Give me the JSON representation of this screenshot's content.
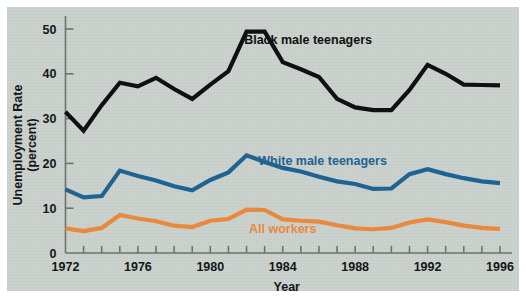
{
  "chart_data": {
    "type": "line",
    "title": "",
    "xlabel": "Year",
    "ylabel": "Unemployment Rate (percent)",
    "ylabel_line1": "Unemployment Rate",
    "ylabel_line2": "(percent)",
    "xlim": [
      1972,
      1996
    ],
    "ylim": [
      0,
      50
    ],
    "ytick_labels": [
      "0",
      "10",
      "20",
      "30",
      "40",
      "50"
    ],
    "ytick_values": [
      0,
      10,
      20,
      30,
      40,
      50
    ],
    "xtick_labels": [
      "1972",
      "1976",
      "1980",
      "1984",
      "1988",
      "1992",
      "1996"
    ],
    "xtick_values": [
      1972,
      1976,
      1980,
      1984,
      1988,
      1992,
      1996
    ],
    "xminor_values": [
      1973,
      1974,
      1975,
      1977,
      1978,
      1979,
      1981,
      1982,
      1983,
      1985,
      1986,
      1987,
      1989,
      1990,
      1991,
      1993,
      1994,
      1995
    ],
    "grid": false,
    "legend_position": "inline-annotations",
    "x": [
      1972,
      1973,
      1974,
      1975,
      1976,
      1977,
      1978,
      1979,
      1980,
      1981,
      1982,
      1983,
      1984,
      1985,
      1986,
      1987,
      1988,
      1989,
      1990,
      1991,
      1992,
      1993,
      1994,
      1995,
      1996
    ],
    "series": [
      {
        "name": "Black male teenagers",
        "color": "#101010",
        "label_x": 1985.4,
        "label_y": 46.6,
        "values": [
          31.5,
          27.3,
          33.0,
          38.0,
          37.2,
          39.1,
          36.6,
          34.4,
          37.6,
          40.6,
          49.4,
          49.4,
          42.6,
          41.0,
          39.3,
          34.4,
          32.5,
          31.9,
          31.9,
          36.4,
          42.0,
          40.0,
          37.6,
          37.5,
          37.4
        ]
      },
      {
        "name": "White male teenagers",
        "color": "#1f6393",
        "label_x": 1986.2,
        "label_y": 19.6,
        "values": [
          14.2,
          12.4,
          12.7,
          18.4,
          17.2,
          16.2,
          14.9,
          14.0,
          16.3,
          18.0,
          21.8,
          20.3,
          19.0,
          18.2,
          17.0,
          16.0,
          15.4,
          14.3,
          14.4,
          17.6,
          18.7,
          17.6,
          16.7,
          16.0,
          15.6
        ]
      },
      {
        "name": "All workers",
        "color": "#e8893c",
        "label_x": 1984.0,
        "label_y": 4.4,
        "values": [
          5.5,
          4.9,
          5.6,
          8.5,
          7.7,
          7.1,
          6.1,
          5.8,
          7.2,
          7.6,
          9.7,
          9.6,
          7.5,
          7.2,
          7.0,
          6.2,
          5.5,
          5.3,
          5.6,
          6.8,
          7.5,
          6.9,
          6.1,
          5.6,
          5.4
        ]
      }
    ]
  },
  "figure": {
    "background_color": "#ccd2cd",
    "page_color": "#ffffff"
  }
}
